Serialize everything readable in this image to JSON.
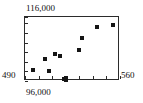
{
  "chart_data": {
    "type": "scatter",
    "title": "",
    "xlabel": "",
    "ylabel": "",
    "xlim": [
      490,
      560
    ],
    "ylim": [
      96000,
      116000
    ],
    "grid": false,
    "legend": null,
    "axis_labels": {
      "x_min": "490",
      "x_max": "560",
      "y_min": "96,000",
      "y_max": "116,000"
    },
    "marker": {
      "shape": "square",
      "color": "#151515",
      "size_px": 4
    },
    "frame_color": "#2b2b2b",
    "background": "#ffffff",
    "x_ticks": [
      490,
      500,
      510,
      520,
      530,
      540,
      550,
      560
    ],
    "y_ticks": [
      96000,
      99000,
      102000,
      105000,
      108000,
      111000,
      114000,
      116000
    ],
    "points": [
      {
        "x": 496,
        "y": 99400
      },
      {
        "x": 505,
        "y": 102800
      },
      {
        "x": 508,
        "y": 99100
      },
      {
        "x": 512,
        "y": 104400
      },
      {
        "x": 516,
        "y": 103800
      },
      {
        "x": 519,
        "y": 96600
      },
      {
        "x": 520,
        "y": 96200
      },
      {
        "x": 520,
        "y": 96900
      },
      {
        "x": 530,
        "y": 105600
      },
      {
        "x": 532,
        "y": 109400
      },
      {
        "x": 543,
        "y": 112800
      },
      {
        "x": 555,
        "y": 113400
      }
    ]
  }
}
